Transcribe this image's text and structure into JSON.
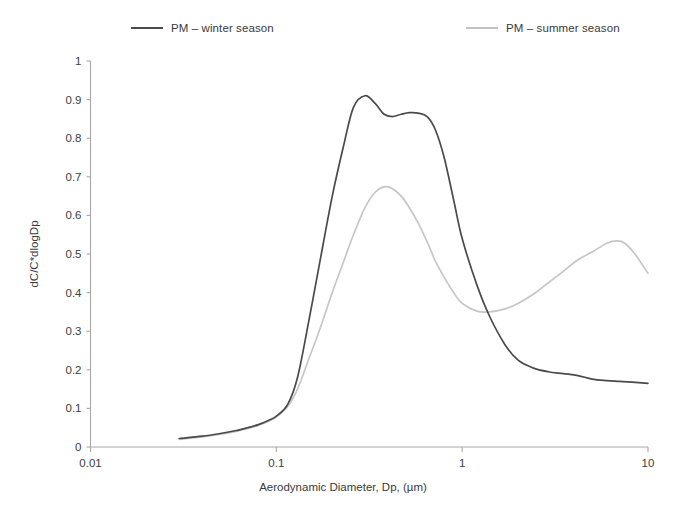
{
  "chart_data": {
    "type": "line",
    "title": "",
    "xlabel": "Aerodynamic Diameter, Dp, (µm)",
    "ylabel": "dC/C*dlogDp",
    "xscale": "log",
    "xlim": [
      0.01,
      10
    ],
    "ylim": [
      0,
      1
    ],
    "xticks": [
      "0.01",
      "0.1",
      "1",
      "10"
    ],
    "xtick_values": [
      0.01,
      0.1,
      1,
      10
    ],
    "yticks": [
      "0",
      "0.1",
      "0.2",
      "0.3",
      "0.4",
      "0.5",
      "0.6",
      "0.7",
      "0.8",
      "0.9",
      "1"
    ],
    "ytick_values": [
      0,
      0.1,
      0.2,
      0.3,
      0.4,
      0.5,
      0.6,
      0.7,
      0.8,
      0.9,
      1
    ],
    "grid": false,
    "legend_position": "top",
    "series": [
      {
        "name": "PM – winter season",
        "color": "#4a4a4a",
        "x": [
          0.03,
          0.04,
          0.05,
          0.06,
          0.07,
          0.08,
          0.09,
          0.1,
          0.115,
          0.13,
          0.15,
          0.17,
          0.2,
          0.23,
          0.26,
          0.3,
          0.34,
          0.38,
          0.42,
          0.47,
          0.52,
          0.58,
          0.65,
          0.72,
          0.8,
          0.9,
          1.0,
          1.2,
          1.4,
          1.7,
          2.0,
          2.4,
          2.9,
          3.5,
          4.2,
          5.0,
          6.0,
          7.0,
          8.2,
          10.0
        ],
        "y": [
          0.022,
          0.028,
          0.035,
          0.042,
          0.05,
          0.058,
          0.068,
          0.08,
          0.11,
          0.18,
          0.33,
          0.47,
          0.65,
          0.78,
          0.88,
          0.91,
          0.89,
          0.862,
          0.856,
          0.862,
          0.866,
          0.865,
          0.855,
          0.82,
          0.75,
          0.64,
          0.54,
          0.42,
          0.34,
          0.265,
          0.225,
          0.205,
          0.195,
          0.19,
          0.185,
          0.176,
          0.172,
          0.17,
          0.168,
          0.165
        ]
      },
      {
        "name": "PM – summer season",
        "color": "#c6c6c6",
        "x": [
          0.03,
          0.04,
          0.05,
          0.06,
          0.07,
          0.08,
          0.09,
          0.1,
          0.115,
          0.13,
          0.15,
          0.17,
          0.2,
          0.23,
          0.26,
          0.3,
          0.34,
          0.38,
          0.42,
          0.47,
          0.52,
          0.58,
          0.65,
          0.72,
          0.8,
          0.9,
          1.0,
          1.2,
          1.4,
          1.7,
          2.0,
          2.4,
          2.9,
          3.5,
          4.2,
          5.0,
          6.0,
          6.8,
          7.5,
          8.5,
          10.0
        ],
        "y": [
          0.02,
          0.026,
          0.033,
          0.04,
          0.048,
          0.056,
          0.066,
          0.078,
          0.105,
          0.15,
          0.23,
          0.3,
          0.4,
          0.48,
          0.55,
          0.62,
          0.66,
          0.674,
          0.67,
          0.65,
          0.62,
          0.58,
          0.53,
          0.48,
          0.44,
          0.4,
          0.372,
          0.352,
          0.35,
          0.358,
          0.372,
          0.395,
          0.425,
          0.455,
          0.485,
          0.505,
          0.528,
          0.534,
          0.528,
          0.5,
          0.45
        ]
      }
    ],
    "annotations": []
  },
  "legend": {
    "entries": [
      {
        "label": "PM – winter season",
        "color": "#4a4a4a"
      },
      {
        "label": "PM – summer season",
        "color": "#c6c6c6"
      }
    ]
  },
  "axes": {
    "y_title": "dC/C*dlogDp",
    "x_title": "Aerodynamic Diameter, Dp, (µm)",
    "y_tick_labels": [
      "1",
      "0.9",
      "0.8",
      "0.7",
      "0.6",
      "0.5",
      "0.4",
      "0.3",
      "0.2",
      "0.1",
      "0"
    ],
    "x_tick_labels": [
      "0.01",
      "0.1",
      "1",
      "10"
    ]
  },
  "colors": {
    "winter": "#4a4a4a",
    "summer": "#c6c6c6",
    "axis": "#a8a8a8",
    "text": "#3a3a3a",
    "background": "#ffffff"
  }
}
